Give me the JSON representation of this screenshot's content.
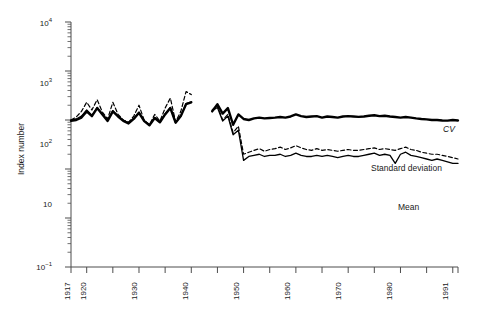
{
  "chart_data": {
    "type": "line",
    "title": "",
    "xlabel": "",
    "ylabel": "Index number",
    "yscale": "log",
    "ylim": [
      0.1,
      10000
    ],
    "xlim": [
      1917,
      1991
    ],
    "grid": false,
    "legend_position": "inline-right",
    "y_tick_labels": [
      "10",
      "10",
      "10",
      "10",
      "10"
    ],
    "y_ticks": [
      10000,
      1000,
      100,
      10,
      0.1
    ],
    "y_tick_text": [
      "10⁴",
      "10³",
      "10²",
      "10",
      "10⁻¹"
    ],
    "x_ticks": [
      1917,
      1920,
      1930,
      1940,
      1950,
      1960,
      1970,
      1980,
      1991
    ],
    "x_tick_labels": [
      "1917",
      "1920",
      "1930",
      "1940",
      "1950",
      "1960",
      "1970",
      "1980",
      "1991"
    ],
    "data_gap_years": [
      1941,
      1942,
      1943
    ],
    "series": [
      {
        "name": "CV",
        "style": "solid-thick",
        "x": [
          1917,
          1918,
          1919,
          1920,
          1921,
          1922,
          1923,
          1924,
          1925,
          1926,
          1927,
          1928,
          1929,
          1930,
          1931,
          1932,
          1933,
          1934,
          1935,
          1936,
          1937,
          1938,
          1939,
          1940,
          1944,
          1945,
          1946,
          1947,
          1948,
          1949,
          1950,
          1951,
          1952,
          1953,
          1954,
          1955,
          1956,
          1957,
          1958,
          1959,
          1960,
          1961,
          1962,
          1963,
          1964,
          1965,
          1966,
          1967,
          1968,
          1969,
          1970,
          1971,
          1972,
          1973,
          1974,
          1975,
          1976,
          1977,
          1978,
          1979,
          1980,
          1981,
          1982,
          1983,
          1984,
          1985,
          1986,
          1987,
          1988,
          1989,
          1990,
          1991
        ],
        "values": [
          96,
          100,
          112,
          150,
          120,
          175,
          130,
          96,
          150,
          118,
          96,
          85,
          105,
          140,
          95,
          78,
          110,
          90,
          130,
          175,
          88,
          120,
          210,
          230,
          150,
          210,
          135,
          175,
          80,
          130,
          105,
          100,
          108,
          112,
          108,
          110,
          112,
          115,
          112,
          118,
          130,
          120,
          115,
          118,
          120,
          112,
          118,
          115,
          112,
          118,
          120,
          118,
          116,
          118,
          122,
          125,
          120,
          122,
          118,
          115,
          112,
          115,
          112,
          108,
          105,
          103,
          100,
          100,
          98,
          97,
          100,
          98
        ]
      },
      {
        "name": "Standard deviation",
        "style": "dashed",
        "x": [
          1917,
          1918,
          1919,
          1920,
          1921,
          1922,
          1923,
          1924,
          1925,
          1926,
          1927,
          1928,
          1929,
          1930,
          1931,
          1932,
          1933,
          1934,
          1935,
          1936,
          1937,
          1938,
          1939,
          1940,
          1944,
          1945,
          1946,
          1947,
          1948,
          1949,
          1950,
          1951,
          1952,
          1953,
          1954,
          1955,
          1956,
          1957,
          1958,
          1959,
          1960,
          1961,
          1962,
          1963,
          1964,
          1965,
          1966,
          1967,
          1968,
          1969,
          1970,
          1971,
          1972,
          1973,
          1974,
          1975,
          1976,
          1977,
          1978,
          1979,
          1980,
          1981,
          1982,
          1983,
          1984,
          1985,
          1986,
          1987,
          1988,
          1989,
          1990,
          1991
        ],
        "values": [
          100,
          115,
          150,
          230,
          160,
          260,
          145,
          105,
          230,
          130,
          100,
          90,
          120,
          200,
          98,
          80,
          130,
          95,
          175,
          280,
          92,
          150,
          380,
          330,
          160,
          200,
          100,
          130,
          55,
          75,
          20,
          22,
          24,
          26,
          23,
          25,
          26,
          28,
          25,
          27,
          30,
          27,
          25,
          24,
          26,
          24,
          25,
          24,
          23,
          24,
          25,
          24,
          24,
          25,
          26,
          27,
          25,
          26,
          25,
          24,
          26,
          28,
          25,
          24,
          22,
          21,
          20,
          20,
          19,
          18,
          17,
          16
        ]
      },
      {
        "name": "Mean",
        "style": "solid-thin",
        "x": [
          1917,
          1918,
          1919,
          1920,
          1921,
          1922,
          1923,
          1924,
          1925,
          1926,
          1927,
          1928,
          1929,
          1930,
          1931,
          1932,
          1933,
          1934,
          1935,
          1936,
          1937,
          1938,
          1939,
          1940,
          1944,
          1945,
          1946,
          1947,
          1948,
          1949,
          1950,
          1951,
          1952,
          1953,
          1954,
          1955,
          1956,
          1957,
          1958,
          1959,
          1960,
          1961,
          1962,
          1963,
          1964,
          1965,
          1966,
          1967,
          1968,
          1969,
          1970,
          1971,
          1972,
          1973,
          1974,
          1975,
          1976,
          1977,
          1978,
          1979,
          1980,
          1981,
          1982,
          1983,
          1984,
          1985,
          1986,
          1987,
          1988,
          1989,
          1990,
          1991
        ],
        "values": [
          100,
          105,
          120,
          160,
          125,
          180,
          130,
          98,
          155,
          120,
          98,
          88,
          108,
          145,
          96,
          78,
          112,
          90,
          135,
          180,
          88,
          122,
          215,
          235,
          155,
          180,
          95,
          120,
          50,
          62,
          15,
          18,
          19,
          20,
          18,
          19,
          19,
          20,
          18,
          19,
          21,
          19,
          18,
          18,
          19,
          18,
          19,
          18,
          17,
          18,
          19,
          18,
          18,
          19,
          20,
          21,
          19,
          20,
          19,
          13,
          20,
          22,
          19,
          18,
          17,
          16,
          15,
          16,
          15,
          14,
          13,
          13
        ]
      }
    ],
    "series_labels": [
      {
        "name": "CV",
        "italic": true
      },
      {
        "name": "Standard deviation",
        "italic": false
      },
      {
        "name": "Mean",
        "italic": false
      }
    ],
    "colors": {
      "line": "#000000",
      "axis": "#4d4d4d",
      "text": "#1a1a1a"
    }
  },
  "axis": {
    "ylabel": "Index number",
    "y_tick_text": [
      "10⁴",
      "10³",
      "10²",
      "10",
      "10⁻¹"
    ],
    "x_tick_labels": [
      "1917",
      "1920",
      "1930",
      "1940",
      "1950",
      "1960",
      "1970",
      "1980",
      "1991"
    ]
  },
  "labels": {
    "cv": "CV",
    "standard_deviation": "Standard deviation",
    "mean": "Mean"
  }
}
